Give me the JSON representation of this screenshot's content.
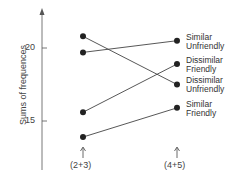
{
  "chart_data": {
    "type": "line",
    "title": "",
    "xlabel": "",
    "ylabel": "Sums of frequences",
    "categories": [
      "(2+3)",
      "(4+5)"
    ],
    "yticks": [
      15,
      20
    ],
    "ylim": [
      12,
      23
    ],
    "grid": false,
    "series": [
      {
        "name": "Similar Unfriendly",
        "values": [
          19.7,
          20.5
        ]
      },
      {
        "name": "Dissimilar Friendly",
        "values": [
          15.6,
          18.9
        ]
      },
      {
        "name": "Dissimilar Unfriendly",
        "values": [
          20.8,
          17.5
        ]
      },
      {
        "name": "Similar Friendly",
        "values": [
          13.9,
          15.9
        ]
      }
    ],
    "legend_position": "right-inline"
  },
  "labels": {
    "s0": [
      "Similar",
      "Unfriendly"
    ],
    "s1": [
      "Dissimilar",
      "Friendly"
    ],
    "s2": [
      "Dissimilar",
      "Unfriendly"
    ],
    "s3": [
      "Similar",
      "Friendly"
    ]
  },
  "color": "#222222"
}
